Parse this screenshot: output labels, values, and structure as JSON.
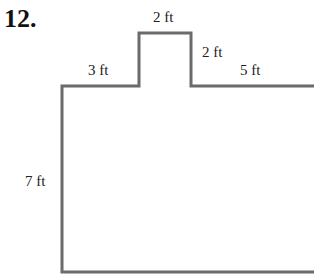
{
  "problem_number": "12.",
  "diagram": {
    "line_color": "#6b6b6b",
    "labels": {
      "top_tab_width": "2 ft",
      "left_top_segment": "3 ft",
      "tab_height": "2 ft",
      "right_top_segment": "5 ft",
      "left_side": "7 ft"
    }
  }
}
